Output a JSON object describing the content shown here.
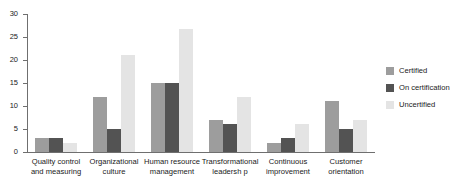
{
  "chart_data": {
    "type": "bar",
    "title": "",
    "xlabel": "",
    "ylabel": "",
    "ylim": [
      0,
      30
    ],
    "yticks": [
      0,
      5,
      10,
      15,
      20,
      25,
      30
    ],
    "ytick_labels": [
      "0",
      "5",
      "10",
      "15",
      "20",
      "25",
      "30"
    ],
    "grid": false,
    "legend_position": "right",
    "categories": [
      "Quality control\nand measuring",
      "Organizational\nculture",
      "Human resource\nmanagement",
      "Transformational\nleadersh p",
      "Continuous\nimprovement",
      "Customer\norientation"
    ],
    "series": [
      {
        "name": "Certified",
        "color": "#9d9d9d",
        "values": [
          3,
          12,
          15,
          7,
          2,
          11
        ]
      },
      {
        "name": "On certification",
        "color": "#535353",
        "values": [
          3,
          5,
          15,
          6,
          3,
          5
        ]
      },
      {
        "name": "Uncertified",
        "color": "#e4e4e4",
        "values": [
          2,
          21,
          26.7,
          12,
          6,
          7
        ]
      }
    ]
  },
  "legend": {
    "items": [
      {
        "label": "Certified"
      },
      {
        "label": "On certification"
      },
      {
        "label": "Uncertified"
      }
    ]
  }
}
